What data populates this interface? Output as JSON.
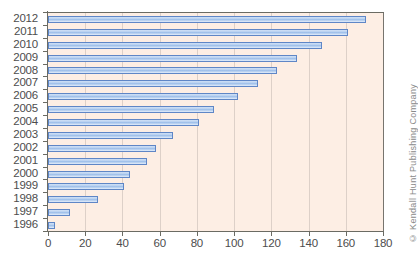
{
  "chart_data": {
    "type": "bar",
    "orientation": "horizontal",
    "title": "",
    "xlabel": "",
    "ylabel": "",
    "xlim": [
      0,
      180
    ],
    "xticks": [
      0,
      20,
      40,
      60,
      80,
      100,
      120,
      140,
      160,
      180
    ],
    "grid": true,
    "legend": null,
    "categories": [
      "2012",
      "2011",
      "2010",
      "2009",
      "2008",
      "2007",
      "2006",
      "2005",
      "2004",
      "2003",
      "2002",
      "2001",
      "2000",
      "1999",
      "1998",
      "1997",
      "1996"
    ],
    "values": [
      171,
      161,
      147,
      134,
      123,
      113,
      102,
      89,
      81,
      67,
      58,
      53,
      44,
      41,
      27,
      12,
      4
    ],
    "series": [
      {
        "name": "",
        "values": [
          171,
          161,
          147,
          134,
          123,
          113,
          102,
          89,
          81,
          67,
          58,
          53,
          44,
          41,
          27,
          12,
          4
        ]
      }
    ]
  },
  "colors": {
    "plot_background": "#fdeee4",
    "bar_fill": "#bfd5f2",
    "bar_border": "#5f86c6",
    "axis": "#6b6b63",
    "tick_text": "#4d4d4d",
    "credit_text": "#8a8a8a",
    "page_background": "#ffffff"
  },
  "credit": {
    "text": "© Kendall Hunt Publishing Company"
  }
}
